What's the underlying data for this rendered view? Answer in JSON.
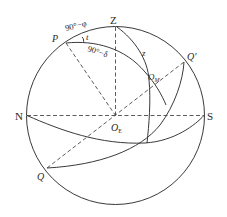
{
  "diagram": {
    "type": "celestial-sphere",
    "colors": {
      "stroke": "#3a3a3a",
      "text": "#2a2a2a",
      "background": "#ffffff"
    },
    "labels": {
      "zenith": "Z",
      "pole": "P",
      "north": "N",
      "south": "S",
      "equator_upper": "Q'",
      "equator_lower": "Q",
      "center_main": "O",
      "center_sub": "E",
      "star_main": "O",
      "star_sub": "M",
      "zenith_distance": "z",
      "colatitude": "90°−φ",
      "codeclination": "90°−δ",
      "hour_angle": "t"
    }
  }
}
